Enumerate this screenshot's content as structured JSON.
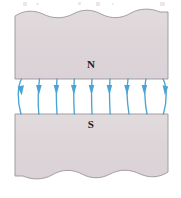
{
  "figure": {
    "type": "physics-diagram",
    "canvas": {
      "width": 181,
      "height": 198,
      "background": "#ffffff"
    },
    "magnets": {
      "fill": "#ddd5d8",
      "stroke": "#9c9499",
      "left": 15,
      "right": 168,
      "north": {
        "label": "N",
        "top": 10,
        "bottom": 79,
        "edge_style": "wavy-break-top",
        "label_x": 91,
        "label_y": 64
      },
      "south": {
        "label": "S",
        "top": 114,
        "bottom": 180,
        "edge_style": "wavy-break-bottom",
        "label_x": 91,
        "label_y": 126
      }
    },
    "field": {
      "color": "#4ba3d3",
      "direction": "downward (north pole to south pole)",
      "line_count": 9,
      "gap_top": 79,
      "gap_bottom": 114,
      "arrowhead_y": 90,
      "line_x_positions": [
        21,
        39,
        57,
        74,
        92,
        110,
        128,
        146,
        163
      ],
      "edge_lines_bulge_outward": true
    },
    "artifacts": {
      "note": "faint scanner marks from cut-off text above the figure",
      "marks": [
        {
          "x": 23,
          "y": 2,
          "w": 4,
          "h": 4
        },
        {
          "x": 36,
          "y": 3,
          "w": 3,
          "h": 2
        },
        {
          "x": 78,
          "y": 2,
          "w": 3,
          "h": 3
        },
        {
          "x": 96,
          "y": 2,
          "w": 4,
          "h": 4
        },
        {
          "x": 112,
          "y": 3,
          "w": 2,
          "h": 2
        },
        {
          "x": 160,
          "y": 2,
          "w": 5,
          "h": 4
        }
      ]
    }
  }
}
